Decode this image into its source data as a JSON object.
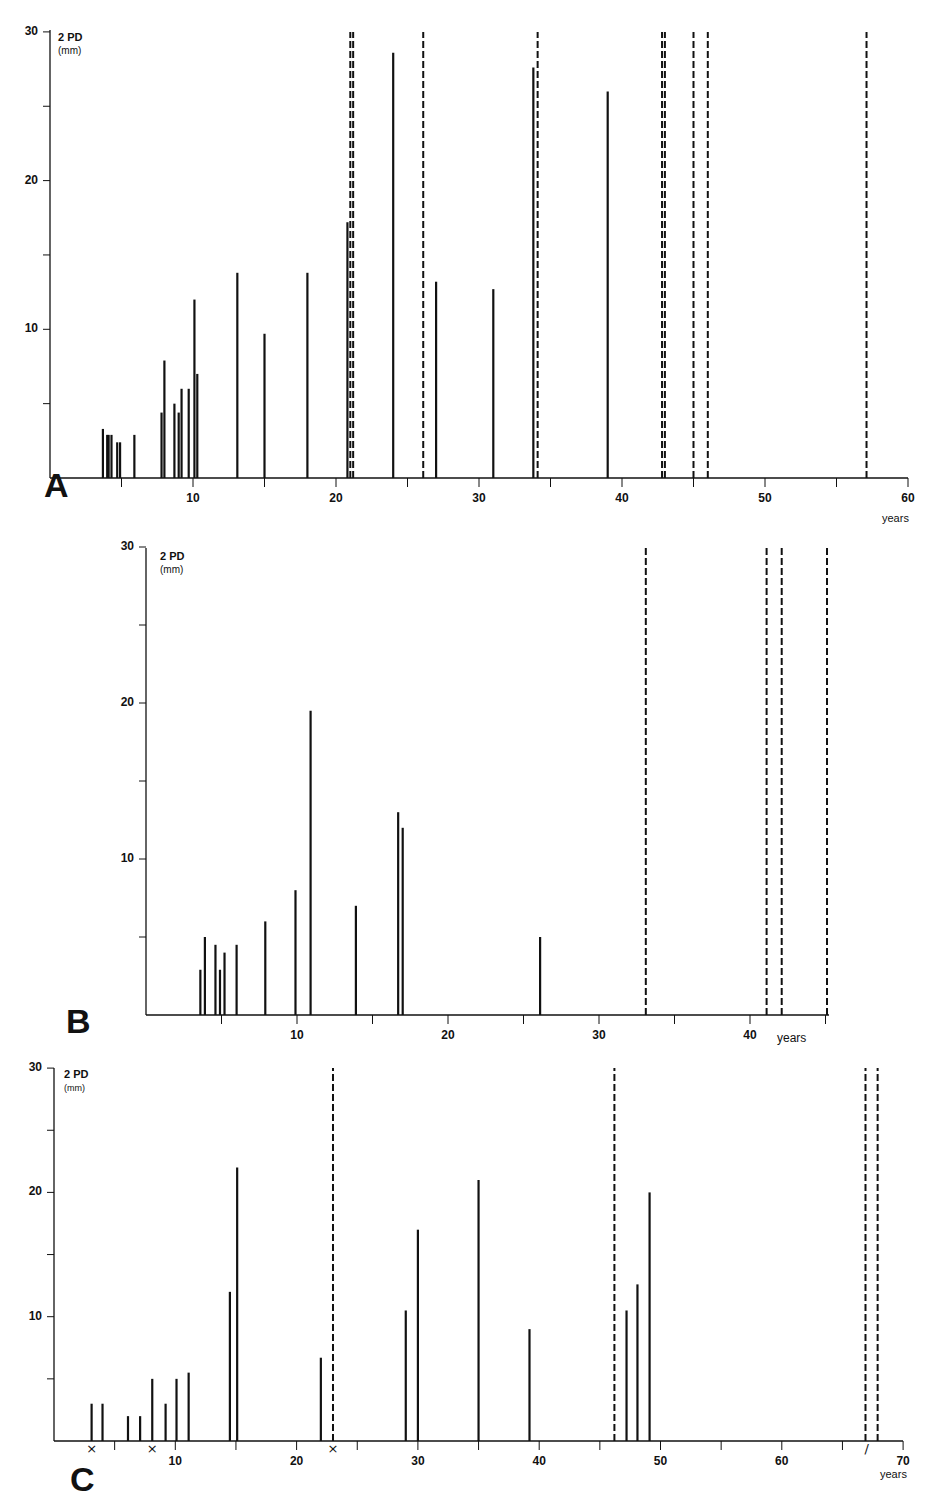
{
  "chart_data": [
    {
      "panel": "A",
      "type": "bar",
      "title": "",
      "ylabel": "2 PD",
      "yunit": "(mm)",
      "xlabel": "years",
      "xlim": [
        0,
        60
      ],
      "ylim": [
        0,
        30
      ],
      "xticks_major": [
        10,
        20,
        30,
        40,
        50,
        60
      ],
      "xticks_minor": [
        5,
        15,
        25,
        35,
        45,
        55
      ],
      "yticks_major": [
        10,
        20,
        30
      ],
      "yticks_minor": [
        5,
        15,
        25
      ],
      "grid": false,
      "series": [
        {
          "name": "measured 2PD (solid)",
          "style": "solid",
          "x": [
            3.7,
            4.0,
            4.1,
            4.3,
            4.7,
            4.9,
            5.9,
            7.8,
            8.0,
            8.7,
            9.0,
            9.2,
            9.7,
            10.1,
            10.3,
            13.1,
            15.0,
            18.0,
            20.8,
            24.0,
            27.0,
            31.0,
            33.8,
            39.0
          ],
          "values": [
            3.3,
            2.9,
            2.9,
            2.9,
            2.4,
            2.4,
            2.9,
            4.4,
            7.9,
            5.0,
            4.4,
            6.0,
            6.0,
            12.0,
            7.0,
            13.8,
            9.7,
            13.8,
            17.2,
            28.6,
            13.2,
            12.7,
            27.6,
            26.0
          ]
        },
        {
          "name": "no 2PD / >30 mm (dashed)",
          "style": "dashed",
          "x": [
            21.0,
            21.2,
            26.1,
            34.1,
            42.8,
            43.0,
            45.0,
            46.0,
            57.1
          ],
          "values": [
            30,
            30,
            30,
            30,
            30,
            30,
            30,
            30,
            30
          ]
        }
      ],
      "markers": []
    },
    {
      "panel": "B",
      "type": "bar",
      "title": "",
      "ylabel": "2 PD",
      "yunit": "(mm)",
      "xlabel": "years",
      "xlim": [
        0,
        45
      ],
      "ylim": [
        0,
        30
      ],
      "xticks_major": [
        10,
        20,
        30,
        40
      ],
      "xticks_minor": [
        5,
        15,
        25,
        35,
        45
      ],
      "yticks_major": [
        10,
        20,
        30
      ],
      "yticks_minor": [
        5,
        15,
        25
      ],
      "grid": false,
      "series": [
        {
          "name": "measured 2PD (solid)",
          "style": "solid",
          "x": [
            3.6,
            3.9,
            4.6,
            4.9,
            5.2,
            6.0,
            7.9,
            9.9,
            10.9,
            13.9,
            16.7,
            17.0,
            26.1
          ],
          "values": [
            2.9,
            5.0,
            4.5,
            2.9,
            4.0,
            4.5,
            6.0,
            8.0,
            19.5,
            7.0,
            13.0,
            12.0,
            5.0
          ]
        },
        {
          "name": "no 2PD / >30 mm (dashed)",
          "style": "dashed",
          "x": [
            33.1,
            41.1,
            42.1,
            45.1
          ],
          "values": [
            30,
            30,
            30,
            30
          ]
        }
      ],
      "markers": []
    },
    {
      "panel": "C",
      "type": "bar",
      "title": "",
      "ylabel": "2 PD",
      "yunit": "(mm)",
      "xlabel": "years",
      "xlim": [
        0,
        70
      ],
      "ylim": [
        0,
        30
      ],
      "xticks_major": [
        10,
        20,
        30,
        40,
        50,
        60,
        70
      ],
      "xticks_minor": [
        5,
        15,
        25,
        35,
        45,
        55,
        65
      ],
      "yticks_major": [
        10,
        20,
        30
      ],
      "yticks_minor": [
        5,
        15,
        25
      ],
      "grid": false,
      "series": [
        {
          "name": "measured 2PD (solid)",
          "style": "solid",
          "x": [
            3.1,
            4.0,
            6.1,
            7.1,
            8.1,
            9.2,
            10.1,
            11.1,
            14.5,
            15.1,
            22.0,
            29.0,
            30.0,
            35.0,
            39.2,
            47.2,
            48.1,
            49.1
          ],
          "values": [
            3.0,
            3.0,
            2.0,
            2.0,
            5.0,
            3.0,
            5.0,
            5.5,
            12.0,
            22.0,
            6.7,
            10.5,
            17.0,
            21.0,
            9.0,
            10.5,
            12.6,
            20.0
          ]
        },
        {
          "name": "no 2PD / >30 mm (dashed)",
          "style": "dashed",
          "x": [
            23.0,
            46.2,
            66.9,
            67.9
          ],
          "values": [
            30,
            30,
            30,
            30
          ]
        }
      ],
      "markers": [
        {
          "x": 3.1,
          "symbol": "×"
        },
        {
          "x": 8.1,
          "symbol": "×"
        },
        {
          "x": 23.0,
          "symbol": "×"
        },
        {
          "x": 67.0,
          "symbol": "/"
        }
      ]
    }
  ],
  "panels": {
    "A": {
      "letter": "A",
      "ylabel": "2 PD",
      "yunit": "(mm)",
      "xunit": "years"
    },
    "B": {
      "letter": "B",
      "ylabel": "2 PD",
      "yunit": "(mm)",
      "xunit": "years"
    },
    "C": {
      "letter": "C",
      "ylabel": "2 PD",
      "yunit": "(mm)",
      "xunit": "years"
    }
  },
  "colors": {
    "ink": "#111111",
    "background": "#ffffff"
  }
}
